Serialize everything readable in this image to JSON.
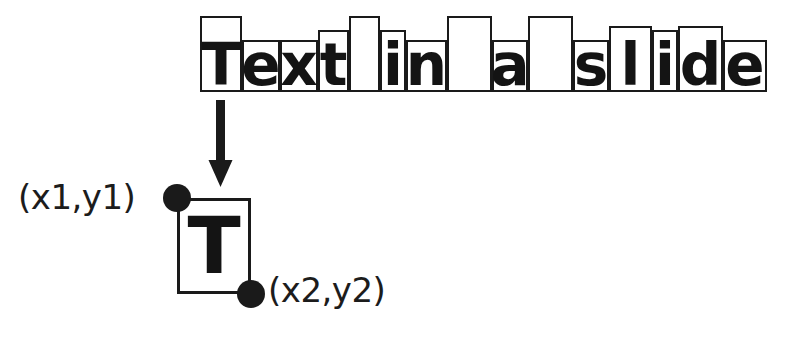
{
  "diagram": {
    "ink_color": "#1a1a1a",
    "background_color": "#ffffff",
    "top_row": {
      "name": "per-character-bounding-boxes",
      "full_text": "Text in a slide",
      "characters": [
        {
          "glyph": "T",
          "label": "T",
          "is_space": false,
          "x": 0,
          "width": 42,
          "height": 76
        },
        {
          "glyph": "e",
          "label": "e",
          "is_space": false,
          "x": 42,
          "width": 38,
          "height": 52
        },
        {
          "glyph": "x",
          "label": "x",
          "is_space": false,
          "x": 80,
          "width": 38,
          "height": 52
        },
        {
          "glyph": "t",
          "label": "t",
          "is_space": false,
          "x": 118,
          "width": 31,
          "height": 62
        },
        {
          "glyph": " ",
          "label": "space",
          "is_space": true,
          "x": 149,
          "width": 31,
          "height": 76
        },
        {
          "glyph": "i",
          "label": "i",
          "is_space": false,
          "x": 180,
          "width": 26,
          "height": 62
        },
        {
          "glyph": "n",
          "label": "n",
          "is_space": false,
          "x": 206,
          "width": 41,
          "height": 52
        },
        {
          "glyph": " ",
          "label": "space",
          "is_space": true,
          "x": 247,
          "width": 45,
          "height": 76
        },
        {
          "glyph": "a",
          "label": "a",
          "is_space": false,
          "x": 292,
          "width": 36,
          "height": 52
        },
        {
          "glyph": " ",
          "label": "space",
          "is_space": true,
          "x": 328,
          "width": 45,
          "height": 76
        },
        {
          "glyph": "s",
          "label": "s",
          "is_space": false,
          "x": 373,
          "width": 36,
          "height": 52
        },
        {
          "glyph": "l",
          "label": "l",
          "is_space": false,
          "x": 409,
          "width": 43,
          "height": 66
        },
        {
          "glyph": "i",
          "label": "i",
          "is_space": false,
          "x": 452,
          "width": 26,
          "height": 62
        },
        {
          "glyph": "d",
          "label": "d",
          "is_space": false,
          "x": 478,
          "width": 45,
          "height": 66
        },
        {
          "glyph": "e",
          "label": "e",
          "is_space": false,
          "x": 523,
          "width": 44,
          "height": 52
        }
      ]
    },
    "arrow": {
      "name": "zoom-arrow",
      "direction": "down"
    },
    "zoomed_char": {
      "name": "character-bounding-box-detail",
      "glyph": "T",
      "top_left_label": "(x1,y1)",
      "bottom_right_label": "(x2,y2)"
    }
  }
}
